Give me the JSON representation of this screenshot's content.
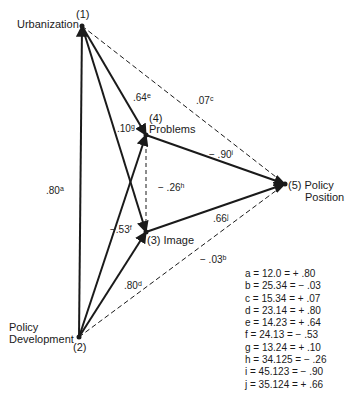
{
  "diagram": {
    "nodes": [
      {
        "id": "1",
        "number": "(1)",
        "label": "Urbanization",
        "x": 82,
        "y": 26
      },
      {
        "id": "2",
        "number": "(2)",
        "label_line1": "Policy",
        "label_line2": "Development",
        "x": 79,
        "y": 337
      },
      {
        "id": "3",
        "number": "(3)",
        "label": "Image",
        "full_label": "(3) Image",
        "x": 146,
        "y": 232
      },
      {
        "id": "4",
        "number": "(4)",
        "label": "Problems",
        "x": 146,
        "y": 135
      },
      {
        "id": "5",
        "number": "(5)",
        "label_line1": "(5) Policy",
        "label_line2": "Position",
        "x": 285,
        "y": 184
      }
    ],
    "edges": [
      {
        "from": "2",
        "to": "1",
        "style": "solid",
        "coef": ".80",
        "key": "a"
      },
      {
        "from": "2",
        "to": "5",
        "style": "dashed",
        "coef": "− .03",
        "key": "b"
      },
      {
        "from": "1",
        "to": "5",
        "style": "dashed",
        "coef": ".07",
        "key": "c"
      },
      {
        "from": "2",
        "to": "3",
        "style": "solid",
        "coef": ".80",
        "key": "d"
      },
      {
        "from": "1",
        "to": "4",
        "style": "solid",
        "coef": ".64",
        "key": "e"
      },
      {
        "from": "2",
        "to": "4",
        "style": "solid",
        "coef": "−.53",
        "key": "f"
      },
      {
        "from": "1",
        "to": "3",
        "style": "solid",
        "coef": ".10",
        "key": "g"
      },
      {
        "from": "4",
        "to": "3",
        "style": "dashed",
        "coef": "− .26",
        "key": "h"
      },
      {
        "from": "4",
        "to": "5",
        "style": "solid",
        "coef": "− .90",
        "key": "i"
      },
      {
        "from": "3",
        "to": "5",
        "style": "solid",
        "coef": ".66",
        "key": "j"
      }
    ],
    "legend": [
      "a = 12.0 = + .80",
      "b = 25.34 = − .03",
      "c = 15.34 = + .07",
      "d = 23.14 = + .80",
      "e = 14.23 = + .64",
      "f = 24.13 = − .53",
      "g = 13.24 = + .10",
      "h = 34.125 = − .26",
      "i = 45.123 = − .90",
      "j = 35.124 = + .66"
    ],
    "colors": {
      "ink": "#1a1a1a",
      "background": "#ffffff"
    }
  }
}
